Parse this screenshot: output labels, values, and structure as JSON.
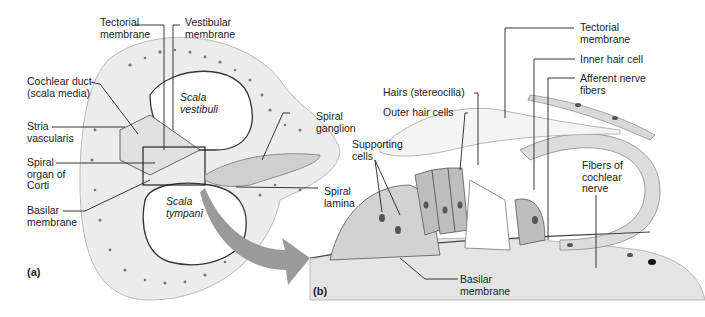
{
  "figure": {
    "panels": [
      {
        "id": "a",
        "label": "(a)"
      },
      {
        "id": "b",
        "label": "(b)"
      }
    ]
  },
  "panel_a": {
    "labels": {
      "tectorial_membrane": "Tectorial\nmembrane",
      "vestibular_membrane": "Vestibular\nmembrane",
      "cochlear_duct": "Cochlear duct\n(scala media)",
      "stria_vascularis": "Stria\nvascularis",
      "spiral_organ": "Spiral\norgan of\nCorti",
      "basilar_membrane": "Basilar\nmembrane",
      "scala_vestibuli": "Scala\nvestibuli",
      "scala_tympani": "Scala\ntympani",
      "spiral_ganglion": "Spiral\nganglion",
      "spiral_lamina": "Spiral\nlamina"
    }
  },
  "panel_b": {
    "labels": {
      "tectorial_membrane": "Tectorial\nmembrane",
      "inner_hair_cell": "Inner hair cell",
      "afferent_nerve_fibers": "Afferent nerve\nfibers",
      "hairs": "Hairs (stereocilia)",
      "outer_hair_cells": "Outer hair cells",
      "supporting_cells": "Supporting\ncells",
      "fibers_cochlear_nerve": "Fibers of\ncochlear\nnerve",
      "basilar_membrane": "Basilar\nmembrane"
    }
  },
  "colors": {
    "line": "#222222",
    "bone_fill": "#ececec",
    "tissue_fill": "#d9d9d9",
    "cell_fill": "#c8c8c8",
    "nucleus": "#555555",
    "arrow": "#9a9a9a"
  }
}
